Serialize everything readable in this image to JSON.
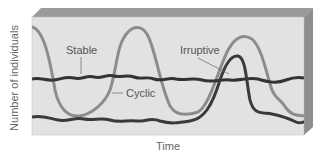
{
  "labels": {
    "y_axis": "Number of individuals",
    "x_axis": "Time",
    "stable": "Stable",
    "cyclic": "Cyclic",
    "irruptive": "Irruptive"
  },
  "colors": {
    "front_face": "#e2e2e2",
    "top_face": "#9a9a9a",
    "side_face": "#8e8e8e",
    "stable_line": "#333333",
    "cyclic_line": "#8c8c8c",
    "irruptive_line": "#3a3a3a"
  }
}
